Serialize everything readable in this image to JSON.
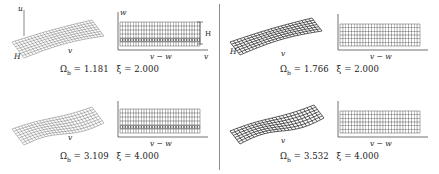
{
  "figure": {
    "type": "mode-shape-figure",
    "panel_count": 4,
    "divider": "vertical-rule",
    "background_color": "#ffffff",
    "ink_color": "#1a1a1a"
  },
  "labels": {
    "omega_symbol": "Ω",
    "omega_sub": "b",
    "xi_symbol": "ξ",
    "equals": "=",
    "axis_u": "u",
    "axis_v": "v",
    "axis_w": "w",
    "axis_v_minus_w": "v − w",
    "axis_H": "H"
  },
  "panels": [
    {
      "id": "top-left",
      "position": "top-left",
      "omega_b": "1.181",
      "xi": "2.000",
      "caption": "Ωb = 1.181  ξ = 2.000",
      "view3d": {
        "style": "wireframe-mesh-surface",
        "shading": "light",
        "axes": [
          "u",
          "v",
          "H"
        ],
        "rows": 8,
        "cols": 26
      },
      "view2d": {
        "style": "dense-grid",
        "xlabel": "v − w",
        "ylabel": "w",
        "xaxis_right_label": "v",
        "height_label": "H",
        "rows": 6,
        "cols": 30
      }
    },
    {
      "id": "top-right",
      "position": "top-right",
      "omega_b": "1.766",
      "xi": "2.000",
      "caption": "Ωb = 1.766  ξ = 2.000",
      "view3d": {
        "style": "wireframe-mesh-surface",
        "shading": "dark",
        "axes": [
          "u",
          "v",
          "H"
        ],
        "rows": 6,
        "cols": 24
      },
      "view2d": {
        "style": "dense-grid",
        "xlabel": "v − w",
        "ylabel": "w",
        "xaxis_right_label": "v",
        "height_label": "H",
        "rows": 6,
        "cols": 28
      }
    },
    {
      "id": "bottom-left",
      "position": "bottom-left",
      "omega_b": "3.109",
      "xi": "4.000",
      "caption": "Ωb = 3.109  ξ = 4.000",
      "view3d": {
        "style": "wireframe-mesh-surface",
        "shading": "light",
        "axes": [
          "u",
          "v",
          "H"
        ],
        "rows": 8,
        "cols": 26
      },
      "view2d": {
        "style": "dense-grid",
        "xlabel": "v − w",
        "ylabel": "w",
        "xaxis_right_label": "v",
        "height_label": "H",
        "rows": 6,
        "cols": 30
      }
    },
    {
      "id": "bottom-right",
      "position": "bottom-right",
      "omega_b": "3.532",
      "xi": "4.000",
      "caption": "Ωb = 3.532  ξ = 4.000",
      "view3d": {
        "style": "wireframe-mesh-surface",
        "shading": "dark",
        "axes": [
          "u",
          "v",
          "H"
        ],
        "rows": 6,
        "cols": 24
      },
      "view2d": {
        "style": "dense-grid",
        "xlabel": "v − w",
        "ylabel": "w",
        "xaxis_right_label": "v",
        "height_label": "H",
        "rows": 6,
        "cols": 28
      }
    }
  ]
}
